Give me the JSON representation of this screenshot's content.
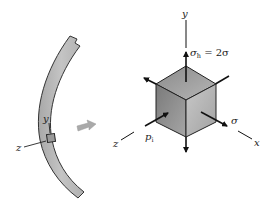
{
  "figure": {
    "shell": {
      "element_labels": {
        "y": "y",
        "z": "z"
      },
      "fill_color": "#b9b9b9",
      "outline_color": "#333333"
    },
    "transition_arrow": {
      "color": "#a9a9a9",
      "direction": "right"
    },
    "stress_element": {
      "axes": {
        "y": "y",
        "x": "x",
        "z": "z"
      },
      "hoop_stress_label": {
        "symbol": "σ",
        "subscript": "h",
        "equals": " = 2σ"
      },
      "longitudinal_stress_label": "σ",
      "internal_pressure_label": {
        "symbol": "p",
        "subscript": "i"
      },
      "face_colors": {
        "top": "#9a9a9a",
        "left": "#8c8c8c",
        "right": "#b4b4b4"
      }
    }
  }
}
